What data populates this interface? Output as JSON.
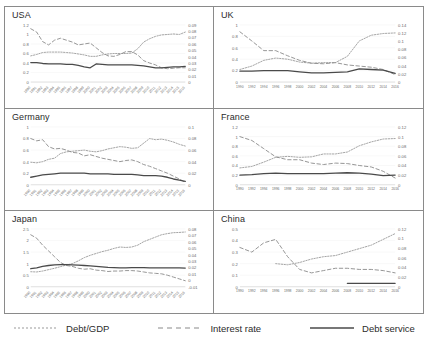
{
  "legend": {
    "position": "bottom-center",
    "items": [
      {
        "label": "Debt/GDP",
        "style": "dotted",
        "color": "#9a9a9a",
        "name": "debt-gdp"
      },
      {
        "label": "Interest rate",
        "style": "dashed",
        "color": "#8a8a8a",
        "name": "interest-rate"
      },
      {
        "label": "Debt service",
        "style": "solid",
        "color": "#4a4a4a",
        "name": "debt-service"
      }
    ]
  },
  "chart_data": [
    {
      "type": "line",
      "title": "USA",
      "xlabel": "",
      "ylabel": "",
      "grid": false,
      "legend": "shared-bottom",
      "x": [
        1990,
        1991,
        1992,
        1993,
        1994,
        1995,
        1996,
        1997,
        1998,
        1999,
        2000,
        2001,
        2002,
        2003,
        2004,
        2005,
        2006,
        2007,
        2008,
        2009,
        2010,
        2011,
        2012,
        2013,
        2014,
        2015,
        2016
      ],
      "xticklabels": [
        "1990",
        "1991",
        "1992",
        "1993",
        "1994",
        "1995",
        "1996",
        "1997",
        "1998",
        "1999",
        "2000",
        "2001",
        "2002",
        "2003",
        "2004",
        "2005",
        "2006",
        "2007",
        "2008",
        "2009",
        "2010",
        "2011",
        "2012",
        "2013",
        "2014",
        "2015",
        "2016"
      ],
      "xtick_rotation": 45,
      "ylim": [
        0,
        1.2
      ],
      "yticks": [
        0,
        0.2,
        0.4,
        0.6,
        0.8,
        1,
        1.2
      ],
      "yticklabels": [
        "0",
        "0.2",
        "0.4",
        "0.6",
        "0.8",
        "1",
        "1.2"
      ],
      "y2lim": [
        0,
        0.09
      ],
      "y2ticks": [
        0,
        0.01,
        0.02,
        0.03,
        0.04,
        0.05,
        0.06,
        0.07,
        0.08,
        0.09
      ],
      "y2ticklabels": [
        "0",
        "0.01",
        "0.02",
        "0.03",
        "0.04",
        "0.05",
        "0.06",
        "0.07",
        "0.08",
        "0.09"
      ],
      "series": [
        {
          "name": "Debt/GDP",
          "axis": "left",
          "style": "dotted",
          "values": [
            0.55,
            0.58,
            0.62,
            0.63,
            0.63,
            0.63,
            0.62,
            0.61,
            0.59,
            0.57,
            0.54,
            0.54,
            0.57,
            0.59,
            0.6,
            0.6,
            0.6,
            0.61,
            0.7,
            0.84,
            0.91,
            0.96,
            0.99,
            1.0,
            1.01,
            1.0,
            1.05
          ]
        },
        {
          "name": "Interest rate",
          "axis": "left",
          "style": "dashed",
          "values": [
            1.12,
            1.05,
            0.85,
            0.78,
            0.88,
            0.92,
            0.88,
            0.84,
            0.78,
            0.8,
            0.82,
            0.72,
            0.62,
            0.55,
            0.54,
            0.58,
            0.64,
            0.64,
            0.57,
            0.45,
            0.4,
            0.36,
            0.3,
            0.28,
            0.29,
            0.3,
            0.3
          ]
        },
        {
          "name": "Debt service",
          "axis": "left",
          "style": "solid",
          "values": [
            0.41,
            0.41,
            0.39,
            0.38,
            0.38,
            0.38,
            0.37,
            0.37,
            0.35,
            0.32,
            0.3,
            0.38,
            0.37,
            0.36,
            0.36,
            0.36,
            0.36,
            0.36,
            0.35,
            0.34,
            0.32,
            0.3,
            0.3,
            0.31,
            0.32,
            0.32,
            0.33
          ]
        }
      ]
    },
    {
      "type": "line",
      "title": "UK",
      "xlabel": "",
      "ylabel": "",
      "grid": false,
      "legend": "shared-bottom",
      "x": [
        1990,
        1992,
        1994,
        1996,
        1998,
        2000,
        2002,
        2004,
        2006,
        2008,
        2010,
        2012,
        2014,
        2016
      ],
      "xticklabels": [
        "1990",
        "1992",
        "1994",
        "1996",
        "1998",
        "2000",
        "2002",
        "2004",
        "2006",
        "2008",
        "2010",
        "2012",
        "2014",
        "2016"
      ],
      "xtick_rotation": 0,
      "ylim": [
        0,
        1
      ],
      "yticks": [
        0,
        0.2,
        0.4,
        0.6,
        0.8,
        1
      ],
      "yticklabels": [
        "0",
        "0.2",
        "0.4",
        "0.6",
        "0.8",
        "1"
      ],
      "y2lim": [
        0,
        0.14
      ],
      "y2ticks": [
        0,
        0.02,
        0.04,
        0.06,
        0.08,
        0.1,
        0.12,
        0.14
      ],
      "y2ticklabels": [
        "0",
        "0.02",
        "0.04",
        "0.06",
        "0.08",
        "0.1",
        "0.12",
        "0.14"
      ],
      "series": [
        {
          "name": "Debt/GDP",
          "axis": "left",
          "style": "dotted",
          "values": [
            0.22,
            0.28,
            0.38,
            0.42,
            0.4,
            0.35,
            0.33,
            0.34,
            0.34,
            0.45,
            0.72,
            0.82,
            0.85,
            0.86
          ]
        },
        {
          "name": "Interest rate",
          "axis": "left",
          "style": "dashed",
          "values": [
            0.88,
            0.72,
            0.55,
            0.55,
            0.46,
            0.38,
            0.33,
            0.32,
            0.34,
            0.3,
            0.28,
            0.26,
            0.22,
            0.13
          ]
        },
        {
          "name": "Debt service",
          "axis": "left",
          "style": "solid",
          "values": [
            0.19,
            0.19,
            0.2,
            0.2,
            0.2,
            0.18,
            0.16,
            0.16,
            0.17,
            0.18,
            0.23,
            0.22,
            0.21,
            0.15
          ]
        }
      ]
    },
    {
      "type": "line",
      "title": "Germany",
      "xlabel": "",
      "ylabel": "",
      "grid": false,
      "legend": "shared-bottom",
      "x": [
        1990,
        1991,
        1992,
        1993,
        1994,
        1995,
        1996,
        1997,
        1998,
        1999,
        2000,
        2001,
        2002,
        2003,
        2004,
        2005,
        2006,
        2007,
        2008,
        2009,
        2010,
        2011,
        2012,
        2013,
        2014,
        2015,
        2016
      ],
      "xticklabels": [
        "1990",
        "1991",
        "1992",
        "1993",
        "1994",
        "1995",
        "1996",
        "1997",
        "1998",
        "1999",
        "2000",
        "2001",
        "2002",
        "2003",
        "2004",
        "2005",
        "2006",
        "2007",
        "2008",
        "2009",
        "2010",
        "2011",
        "2012",
        "2013",
        "2014",
        "2015",
        "2016"
      ],
      "xtick_rotation": 45,
      "ylim": [
        0,
        1
      ],
      "yticks": [
        0,
        0.2,
        0.4,
        0.6,
        0.8,
        1
      ],
      "yticklabels": [
        "0",
        "0.2",
        "0.4",
        "0.6",
        "0.8",
        "1"
      ],
      "y2lim": [
        0,
        0.1
      ],
      "y2ticks": [
        0,
        0.02,
        0.04,
        0.06,
        0.08,
        0.1
      ],
      "y2ticklabels": [
        "0",
        "0.02",
        "0.04",
        "0.06",
        "0.08",
        "0.1"
      ],
      "series": [
        {
          "name": "Debt/GDP",
          "axis": "left",
          "style": "dotted",
          "values": [
            0.39,
            0.38,
            0.4,
            0.44,
            0.46,
            0.54,
            0.57,
            0.58,
            0.59,
            0.6,
            0.58,
            0.57,
            0.59,
            0.62,
            0.64,
            0.66,
            0.65,
            0.63,
            0.64,
            0.72,
            0.8,
            0.78,
            0.79,
            0.77,
            0.74,
            0.7,
            0.67
          ]
        },
        {
          "name": "Interest rate",
          "axis": "left",
          "style": "dashed",
          "values": [
            0.8,
            0.76,
            0.78,
            0.66,
            0.62,
            0.63,
            0.6,
            0.56,
            0.55,
            0.5,
            0.52,
            0.49,
            0.46,
            0.44,
            0.42,
            0.4,
            0.42,
            0.43,
            0.4,
            0.35,
            0.32,
            0.28,
            0.24,
            0.2,
            0.15,
            0.1,
            0.04
          ]
        },
        {
          "name": "Debt service",
          "axis": "left",
          "style": "solid",
          "values": [
            0.13,
            0.15,
            0.17,
            0.18,
            0.19,
            0.2,
            0.2,
            0.2,
            0.2,
            0.2,
            0.19,
            0.19,
            0.19,
            0.19,
            0.18,
            0.18,
            0.18,
            0.18,
            0.17,
            0.16,
            0.16,
            0.16,
            0.15,
            0.13,
            0.1,
            0.08,
            0.06
          ]
        }
      ]
    },
    {
      "type": "line",
      "title": "France",
      "xlabel": "",
      "ylabel": "",
      "grid": false,
      "legend": "shared-bottom",
      "x": [
        1990,
        1992,
        1994,
        1996,
        1998,
        2000,
        2002,
        2004,
        2006,
        2008,
        2010,
        2012,
        2014,
        2016
      ],
      "xticklabels": [
        "1990",
        "1992",
        "1994",
        "1996",
        "1998",
        "2000",
        "2002",
        "2004",
        "2006",
        "2008",
        "2010",
        "2012",
        "2014",
        "2016"
      ],
      "xtick_rotation": 0,
      "ylim": [
        0,
        1.2
      ],
      "yticks": [
        0,
        0.2,
        0.4,
        0.6,
        0.8,
        1,
        1.2
      ],
      "yticklabels": [
        "0",
        "0.2",
        "0.4",
        "0.6",
        "0.8",
        "1",
        "1.2"
      ],
      "y2lim": [
        0,
        0.12
      ],
      "y2ticks": [
        0,
        0.02,
        0.04,
        0.06,
        0.08,
        0.1,
        0.12
      ],
      "y2ticklabels": [
        "0",
        "0.02",
        "0.04",
        "0.06",
        "0.08",
        "0.1",
        "0.12"
      ],
      "series": [
        {
          "name": "Debt/GDP",
          "axis": "left",
          "style": "dotted",
          "values": [
            0.35,
            0.38,
            0.47,
            0.57,
            0.59,
            0.57,
            0.58,
            0.64,
            0.64,
            0.68,
            0.81,
            0.89,
            0.95,
            0.96
          ]
        },
        {
          "name": "Interest rate",
          "axis": "left",
          "style": "dashed",
          "values": [
            1.0,
            0.92,
            0.75,
            0.58,
            0.52,
            0.52,
            0.45,
            0.42,
            0.45,
            0.44,
            0.4,
            0.37,
            0.28,
            0.14
          ]
        },
        {
          "name": "Debt service",
          "axis": "left",
          "style": "solid",
          "values": [
            0.2,
            0.21,
            0.23,
            0.24,
            0.23,
            0.23,
            0.23,
            0.23,
            0.24,
            0.25,
            0.24,
            0.22,
            0.19,
            0.2
          ]
        }
      ]
    },
    {
      "type": "line",
      "title": "Japan",
      "xlabel": "",
      "ylabel": "",
      "grid": false,
      "legend": "shared-bottom",
      "x": [
        1990,
        1991,
        1992,
        1993,
        1994,
        1995,
        1996,
        1997,
        1998,
        1999,
        2000,
        2001,
        2002,
        2003,
        2004,
        2005,
        2006,
        2007,
        2008,
        2009,
        2010,
        2011,
        2012,
        2013,
        2014,
        2015,
        2016
      ],
      "xticklabels": [
        "1990",
        "1991",
        "1992",
        "1993",
        "1994",
        "1995",
        "1996",
        "1997",
        "1998",
        "1999",
        "2000",
        "2001",
        "2002",
        "2003",
        "2004",
        "2005",
        "2006",
        "2007",
        "2008",
        "2009",
        "2010",
        "2011",
        "2012",
        "2013",
        "2014",
        "2015",
        "2016"
      ],
      "xtick_rotation": 45,
      "ylim": [
        0,
        2.5
      ],
      "yticks": [
        0,
        0.5,
        1,
        1.5,
        2,
        2.5
      ],
      "yticklabels": [
        "0",
        "0.5",
        "1",
        "1.5",
        "2",
        "2.5"
      ],
      "y2lim": [
        -0.01,
        0.08
      ],
      "y2ticks": [
        -0.01,
        0,
        0.01,
        0.02,
        0.03,
        0.04,
        0.05,
        0.06,
        0.07,
        0.08
      ],
      "y2ticklabels": [
        "-0.01",
        "0",
        "0.01",
        "0.02",
        "0.03",
        "0.04",
        "0.05",
        "0.06",
        "0.07",
        "0.08"
      ],
      "series": [
        {
          "name": "Debt/GDP",
          "axis": "left",
          "style": "dotted",
          "values": [
            0.65,
            0.64,
            0.68,
            0.74,
            0.8,
            0.87,
            0.94,
            1.0,
            1.12,
            1.26,
            1.36,
            1.44,
            1.52,
            1.58,
            1.66,
            1.72,
            1.7,
            1.72,
            1.8,
            1.95,
            2.05,
            2.15,
            2.25,
            2.3,
            2.34,
            2.35,
            2.37
          ]
        },
        {
          "name": "Interest rate",
          "axis": "left",
          "style": "dashed",
          "values": [
            2.25,
            2.1,
            1.8,
            1.55,
            1.3,
            1.05,
            0.92,
            0.88,
            0.8,
            0.76,
            0.78,
            0.72,
            0.7,
            0.66,
            0.68,
            0.68,
            0.7,
            0.7,
            0.68,
            0.64,
            0.6,
            0.58,
            0.56,
            0.5,
            0.42,
            0.34,
            0.26
          ]
        },
        {
          "name": "Debt service",
          "axis": "left",
          "style": "solid",
          "values": [
            0.78,
            0.82,
            0.88,
            0.92,
            0.95,
            0.96,
            0.96,
            0.95,
            0.94,
            0.92,
            0.9,
            0.88,
            0.86,
            0.84,
            0.83,
            0.82,
            0.82,
            0.83,
            0.83,
            0.83,
            0.82,
            0.82,
            0.82,
            0.82,
            0.82,
            0.82,
            0.81
          ]
        }
      ]
    },
    {
      "type": "line",
      "title": "China",
      "xlabel": "",
      "ylabel": "",
      "grid": false,
      "legend": "shared-bottom",
      "x": [
        1990,
        1992,
        1994,
        1996,
        1998,
        2000,
        2002,
        2004,
        2006,
        2008,
        2010,
        2012,
        2014,
        2016
      ],
      "xticklabels": [
        "1990",
        "1992",
        "1994",
        "1996",
        "1998",
        "2000",
        "2002",
        "2004",
        "2006",
        "2008",
        "2010",
        "2012",
        "2014",
        "2016"
      ],
      "xtick_rotation": 0,
      "ylim": [
        0,
        0.5
      ],
      "yticks": [
        0,
        0.1,
        0.2,
        0.3,
        0.4,
        0.5
      ],
      "yticklabels": [
        "0",
        "0.1",
        "0.2",
        "0.3",
        "0.4",
        "0.5"
      ],
      "y2lim": [
        0,
        0.12
      ],
      "y2ticks": [
        0,
        0.02,
        0.04,
        0.06,
        0.08,
        0.1,
        0.12
      ],
      "y2ticklabels": [
        "0",
        "0.02",
        "0.04",
        "0.06",
        "0.08",
        "0.1",
        "0.12"
      ],
      "series": [
        {
          "name": "Debt/GDP",
          "axis": "left",
          "style": "dotted",
          "values": [
            null,
            null,
            null,
            0.2,
            0.19,
            0.21,
            0.24,
            0.26,
            0.27,
            0.3,
            0.33,
            0.36,
            0.41,
            0.46
          ]
        },
        {
          "name": "Interest rate",
          "axis": "left",
          "style": "dashed",
          "values": [
            0.34,
            0.3,
            0.38,
            0.41,
            0.26,
            0.15,
            0.12,
            0.14,
            0.16,
            0.16,
            0.15,
            0.15,
            0.14,
            0.12
          ]
        },
        {
          "name": "Debt service",
          "axis": "left",
          "style": "solid",
          "values": [
            null,
            null,
            null,
            null,
            null,
            null,
            null,
            null,
            null,
            0.03,
            0.03,
            0.03,
            0.03,
            0.03
          ]
        }
      ]
    }
  ]
}
